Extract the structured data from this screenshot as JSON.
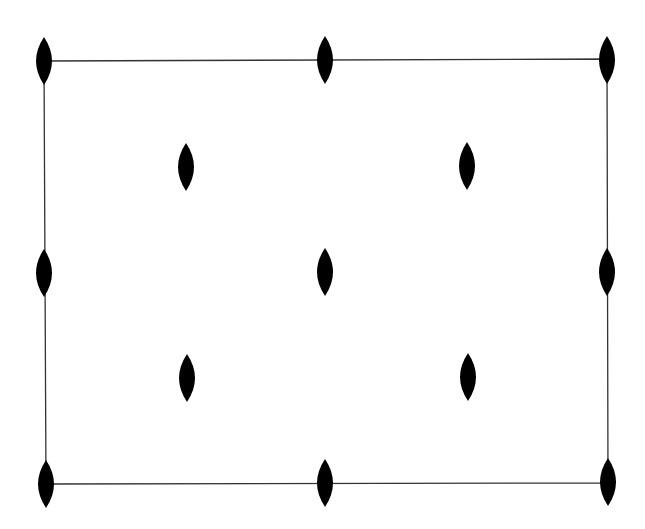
{
  "diagram": {
    "type": "symmetry-diagram",
    "colors": {
      "background": "#ffffff",
      "line": "#333333",
      "marker": "#000000"
    },
    "cell": {
      "corners": [
        [
          44,
          61
        ],
        [
          607,
          59
        ],
        [
          608,
          483
        ],
        [
          46,
          484
        ]
      ]
    },
    "marker_size": {
      "width": 16,
      "height": 48
    },
    "markers": [
      {
        "id": "corner-top-left",
        "icon": "twofold-axis-icon",
        "x": 44,
        "y": 61
      },
      {
        "id": "edge-top-mid",
        "icon": "twofold-axis-icon",
        "x": 325,
        "y": 60
      },
      {
        "id": "corner-top-right",
        "icon": "twofold-axis-icon",
        "x": 607,
        "y": 60
      },
      {
        "id": "interior-upper-left",
        "icon": "twofold-axis-icon",
        "x": 186,
        "y": 167
      },
      {
        "id": "interior-upper-right",
        "icon": "twofold-axis-icon",
        "x": 467,
        "y": 166
      },
      {
        "id": "edge-left-mid",
        "icon": "twofold-axis-icon",
        "x": 44,
        "y": 273
      },
      {
        "id": "center",
        "icon": "twofold-axis-icon",
        "x": 325,
        "y": 272
      },
      {
        "id": "edge-right-mid",
        "icon": "twofold-axis-icon",
        "x": 607,
        "y": 272
      },
      {
        "id": "interior-lower-left",
        "icon": "twofold-axis-icon",
        "x": 187,
        "y": 378
      },
      {
        "id": "interior-lower-right",
        "icon": "twofold-axis-icon",
        "x": 468,
        "y": 377
      },
      {
        "id": "corner-bottom-left",
        "icon": "twofold-axis-icon",
        "x": 46,
        "y": 484
      },
      {
        "id": "edge-bottom-mid",
        "icon": "twofold-axis-icon",
        "x": 325,
        "y": 483
      },
      {
        "id": "corner-bottom-right",
        "icon": "twofold-axis-icon",
        "x": 608,
        "y": 482
      }
    ]
  }
}
